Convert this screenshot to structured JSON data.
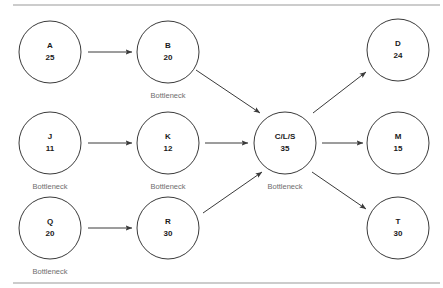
{
  "diagram": {
    "frame": {
      "top_rule": true,
      "bottom_rule": true,
      "rule_color": "#9a9a9a"
    },
    "node_radius": 31,
    "stroke_color": "#3a3a3a",
    "label_color": "#1a1a1a",
    "annotation_color": "#6e6e6e",
    "nodes": [
      {
        "id": "A",
        "letter": "A",
        "value": "25",
        "cx": 50,
        "cy": 52,
        "bottleneck": false,
        "bottleneck_label": ""
      },
      {
        "id": "B",
        "letter": "B",
        "value": "20",
        "cx": 168,
        "cy": 52,
        "bottleneck": true,
        "bottleneck_label": "Bottleneck"
      },
      {
        "id": "J",
        "letter": "J",
        "value": "11",
        "cx": 50,
        "cy": 143,
        "bottleneck": true,
        "bottleneck_label": "Bottleneck"
      },
      {
        "id": "K",
        "letter": "K",
        "value": "12",
        "cx": 168,
        "cy": 143,
        "bottleneck": true,
        "bottleneck_label": "Bottleneck"
      },
      {
        "id": "Q",
        "letter": "Q",
        "value": "20",
        "cx": 50,
        "cy": 228,
        "bottleneck": true,
        "bottleneck_label": "Bottleneck"
      },
      {
        "id": "R",
        "letter": "R",
        "value": "30",
        "cx": 168,
        "cy": 228,
        "bottleneck": false,
        "bottleneck_label": ""
      },
      {
        "id": "CLS",
        "letter": "C/L/S",
        "value": "35",
        "cx": 285,
        "cy": 143,
        "bottleneck": true,
        "bottleneck_label": "Bottleneck"
      },
      {
        "id": "D",
        "letter": "D",
        "value": "24",
        "cx": 398,
        "cy": 50,
        "bottleneck": false,
        "bottleneck_label": ""
      },
      {
        "id": "M",
        "letter": "M",
        "value": "15",
        "cx": 398,
        "cy": 143,
        "bottleneck": false,
        "bottleneck_label": ""
      },
      {
        "id": "T",
        "letter": "T",
        "value": "30",
        "cx": 398,
        "cy": 228,
        "bottleneck": false,
        "bottleneck_label": ""
      }
    ],
    "edges": [
      {
        "from": "A",
        "to": "B",
        "x1": 88,
        "y1": 52,
        "x2": 132,
        "y2": 52
      },
      {
        "from": "J",
        "to": "K",
        "x1": 88,
        "y1": 143,
        "x2": 132,
        "y2": 143
      },
      {
        "from": "Q",
        "to": "R",
        "x1": 88,
        "y1": 228,
        "x2": 132,
        "y2": 228
      },
      {
        "from": "B",
        "to": "CLS",
        "x1": 196,
        "y1": 70,
        "x2": 260,
        "y2": 113
      },
      {
        "from": "K",
        "to": "CLS",
        "x1": 205,
        "y1": 143,
        "x2": 248,
        "y2": 143
      },
      {
        "from": "R",
        "to": "CLS",
        "x1": 203,
        "y1": 213,
        "x2": 262,
        "y2": 172
      },
      {
        "from": "CLS",
        "to": "D",
        "x1": 313,
        "y1": 113,
        "x2": 366,
        "y2": 72
      },
      {
        "from": "CLS",
        "to": "M",
        "x1": 322,
        "y1": 143,
        "x2": 363,
        "y2": 143
      },
      {
        "from": "CLS",
        "to": "T",
        "x1": 312,
        "y1": 172,
        "x2": 366,
        "y2": 209
      }
    ]
  }
}
